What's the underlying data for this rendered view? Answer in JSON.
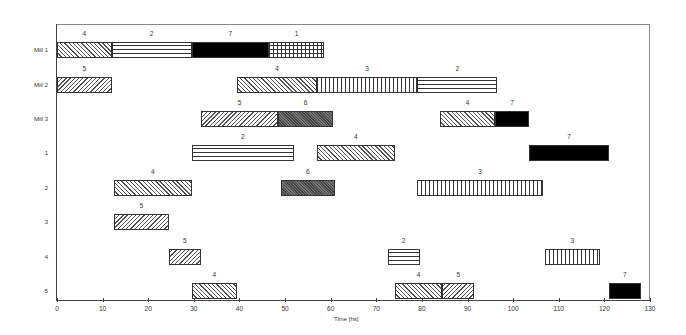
{
  "chart_data": {
    "type": "gantt",
    "title": "",
    "xlabel": "Time [hs]",
    "ylabel": "",
    "xlim": [
      0,
      130
    ],
    "x_ticks": [
      0,
      10,
      20,
      30,
      40,
      50,
      60,
      70,
      80,
      90,
      100,
      110,
      120,
      130
    ],
    "grid": false,
    "legend": null,
    "rows": [
      "Mill 1",
      "Mill 2",
      "Mill 3",
      "1",
      "2",
      "3",
      "4",
      "5"
    ],
    "patterns": {
      "1": "grid",
      "2": "horizontal",
      "3": "vertical",
      "4": "backward-diagonal",
      "5": "forward-diagonal",
      "6": "dark-crosshatch",
      "7": "solid-black"
    },
    "tasks": [
      {
        "row": "Mill 1",
        "label": "4",
        "start": 0,
        "end": 12
      },
      {
        "row": "Mill 1",
        "label": "2",
        "start": 12,
        "end": 29.5
      },
      {
        "row": "Mill 1",
        "label": "7",
        "start": 29.5,
        "end": 46.5
      },
      {
        "row": "Mill 1",
        "label": "1",
        "start": 46.5,
        "end": 58.5
      },
      {
        "row": "Mill 2",
        "label": "5",
        "start": 0,
        "end": 12
      },
      {
        "row": "Mill 2",
        "label": "4",
        "start": 39.5,
        "end": 57
      },
      {
        "row": "Mill 2",
        "label": "3",
        "start": 57,
        "end": 79
      },
      {
        "row": "Mill 2",
        "label": "2",
        "start": 79,
        "end": 96.5
      },
      {
        "row": "Mill 3",
        "label": "5",
        "start": 31.5,
        "end": 48.5
      },
      {
        "row": "Mill 3",
        "label": "6",
        "start": 48.5,
        "end": 60.5
      },
      {
        "row": "Mill 3",
        "label": "4",
        "start": 84,
        "end": 96
      },
      {
        "row": "Mill 3",
        "label": "7",
        "start": 96,
        "end": 103.5
      },
      {
        "row": "1",
        "label": "2",
        "start": 29.5,
        "end": 52
      },
      {
        "row": "1",
        "label": "4",
        "start": 57,
        "end": 74
      },
      {
        "row": "1",
        "label": "7",
        "start": 103.5,
        "end": 121
      },
      {
        "row": "2",
        "label": "4",
        "start": 12.5,
        "end": 29.5
      },
      {
        "row": "2",
        "label": "6",
        "start": 49,
        "end": 61
      },
      {
        "row": "2",
        "label": "3",
        "start": 79,
        "end": 106.5
      },
      {
        "row": "3",
        "label": "5",
        "start": 12.5,
        "end": 24.5
      },
      {
        "row": "4",
        "label": "5",
        "start": 24.5,
        "end": 31.5
      },
      {
        "row": "4",
        "label": "2",
        "start": 72.5,
        "end": 79.5
      },
      {
        "row": "4",
        "label": "3",
        "start": 107,
        "end": 119
      },
      {
        "row": "5",
        "label": "4",
        "start": 29.5,
        "end": 39.5
      },
      {
        "row": "5",
        "label": "4",
        "start": 74,
        "end": 84.5
      },
      {
        "row": "5",
        "label": "5",
        "start": 84.5,
        "end": 91.5
      },
      {
        "row": "5",
        "label": "7",
        "start": 121,
        "end": 128
      }
    ]
  }
}
